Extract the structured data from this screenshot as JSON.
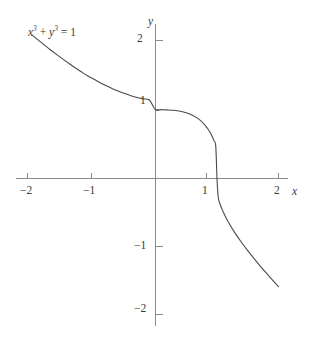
{
  "figure": {
    "background_color": "#ffffff",
    "axis_color": "#8a8a8a",
    "curve_color": "#4a4a4a",
    "text_color": "#3b3b3b"
  },
  "labels": {
    "equation_var1": "x",
    "equation_exp1": "3",
    "equation_plus": " + ",
    "equation_var2": "y",
    "equation_exp2": "3",
    "equation_equals": " = 1",
    "x_axis_name": "x",
    "y_axis_name": "y",
    "x_tick_neg2": "−2",
    "x_tick_neg1": "−1",
    "x_tick_pos1": "1",
    "x_tick_pos2": "2",
    "y_tick_pos2": "2",
    "y_tick_pos1": "1",
    "y_tick_neg1": "−1",
    "y_tick_neg2": "−2"
  },
  "chart_data": {
    "type": "line",
    "title": "",
    "subtitle": "",
    "xlabel": "x",
    "ylabel": "y",
    "equation": "x^3 + y^3 = 1",
    "annotations": [
      {
        "text": "x³ + y³ = 1",
        "x": -1.75,
        "y": 2.2
      }
    ],
    "legend": [],
    "legend_position": "none",
    "grid": false,
    "xlim": [
      -2.25,
      2.25
    ],
    "ylim": [
      -2.35,
      2.45
    ],
    "xticks": [
      -2,
      -1,
      1,
      2
    ],
    "yticks": [
      -2,
      -1,
      1,
      2
    ],
    "xtick_labels": [
      "−2",
      "−1",
      "1",
      "2"
    ],
    "ytick_labels": [
      "−2",
      "−1",
      "1",
      "2"
    ],
    "axis_style": "centered-cross",
    "series": [
      {
        "name": "x³ + y³ = 1",
        "color": "#4a4a4a",
        "x": [
          -2.0,
          -1.9,
          -1.8,
          -1.7,
          -1.6,
          -1.5,
          -1.4,
          -1.3,
          -1.2,
          -1.1,
          -1.0,
          -0.9,
          -0.8,
          -0.7,
          -0.6,
          -0.5,
          -0.4,
          -0.3,
          -0.2,
          -0.1,
          0.0,
          0.1,
          0.2,
          0.3,
          0.4,
          0.5,
          0.6,
          0.7,
          0.8,
          0.85,
          0.9,
          0.95,
          0.98,
          1.0,
          1.02,
          1.05,
          1.1,
          1.15,
          1.2,
          1.3,
          1.4,
          1.5,
          1.6,
          1.7,
          1.8,
          1.9,
          2.0
        ],
        "y": [
          2.08,
          2.007,
          1.935,
          1.865,
          1.797,
          1.731,
          1.667,
          1.606,
          1.547,
          1.491,
          1.442,
          1.392,
          1.347,
          1.306,
          1.268,
          1.234,
          1.204,
          1.178,
          1.157,
          1.141,
          1.0,
          1.0,
          0.997,
          0.991,
          0.978,
          0.956,
          0.921,
          0.866,
          0.781,
          0.723,
          0.651,
          0.551,
          0.467,
          0.0,
          -0.273,
          -0.375,
          -0.484,
          -0.576,
          -0.657,
          -0.801,
          -0.93,
          -1.049,
          -1.161,
          -1.269,
          -1.373,
          -1.474,
          -1.573
        ]
      }
    ]
  }
}
